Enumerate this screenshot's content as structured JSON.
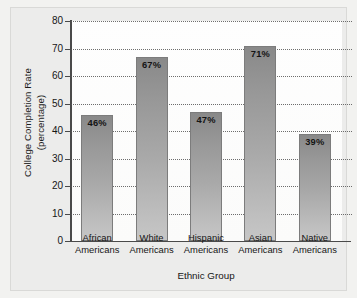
{
  "chart_data": {
    "type": "bar",
    "title": "",
    "xlabel": "Ethnic Group",
    "ylabel": "College Completion Rate (percentage)",
    "ylabel_line1": "College Completion Rate",
    "ylabel_line2": "(percentage)",
    "categories": [
      "African Americans",
      "White Americans",
      "Hispanic Americans",
      "Asian Americans",
      "Native Americans"
    ],
    "category_lines": [
      {
        "line1": "African",
        "line2": "Americans"
      },
      {
        "line1": "White",
        "line2": "Americans"
      },
      {
        "line1": "Hispanic",
        "line2": "Americans"
      },
      {
        "line1": "Asian",
        "line2": "Americans"
      },
      {
        "line1": "Native",
        "line2": "Americans"
      }
    ],
    "values": [
      46,
      67,
      47,
      71,
      39
    ],
    "data_labels": [
      "46%",
      "67%",
      "47%",
      "71%",
      "39%"
    ],
    "ylim": [
      0,
      80
    ],
    "ytick_step": 10,
    "yticks": [
      0,
      10,
      20,
      30,
      40,
      50,
      60,
      70,
      80
    ],
    "ytick_labels": [
      "0",
      "10",
      "20",
      "30",
      "40",
      "50",
      "60",
      "70",
      "80"
    ],
    "grid": true,
    "grid_style": "dotted",
    "legend": false,
    "colors": {
      "bar_top": "#898989",
      "bar_bottom": "#c6c6c6",
      "bar_border": "#7c7c7c",
      "axis": "#4a4a4a",
      "grid": "#555555",
      "plot_background": "#fdfdfd",
      "figure_background": "#ececeb",
      "page_background": "#f2f2f0",
      "text": "#161616"
    }
  }
}
